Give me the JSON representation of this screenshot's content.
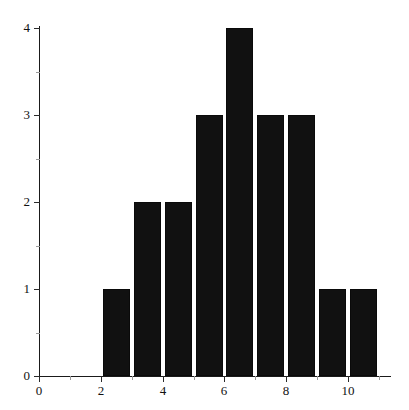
{
  "chart_data": {
    "type": "bar",
    "title": "",
    "subtitle": "",
    "xlabel": "",
    "ylabel": "",
    "grid": false,
    "legend": false,
    "legend_position": "none",
    "bar_color": "#111111",
    "axis_color": "#1a1a1a",
    "xlim": [
      0,
      11.4
    ],
    "ylim": [
      0,
      4
    ],
    "x_ticks_major": [
      0,
      2,
      4,
      6,
      8,
      10
    ],
    "x_ticks_minor": [
      1,
      3,
      5,
      7,
      9,
      11
    ],
    "x_tick_labels": [
      "0",
      "2",
      "4",
      "6",
      "8",
      "10"
    ],
    "y_ticks_major": [
      0,
      1,
      2,
      3,
      4
    ],
    "y_ticks_minor": [
      0.5,
      1.5,
      2.5,
      3.5
    ],
    "y_tick_labels": [
      "0",
      "1",
      "2",
      "3",
      "4"
    ],
    "bin_width": 1,
    "bins": [
      {
        "left": 2,
        "right": 3,
        "count": 1
      },
      {
        "left": 3,
        "right": 4,
        "count": 2
      },
      {
        "left": 4,
        "right": 5,
        "count": 2
      },
      {
        "left": 5,
        "right": 6,
        "count": 3
      },
      {
        "left": 6,
        "right": 7,
        "count": 4
      },
      {
        "left": 7,
        "right": 8,
        "count": 3
      },
      {
        "left": 8,
        "right": 9,
        "count": 3
      },
      {
        "left": 9,
        "right": 10,
        "count": 1
      },
      {
        "left": 10,
        "right": 11,
        "count": 1
      }
    ],
    "categories": [
      "2-3",
      "3-4",
      "4-5",
      "5-6",
      "6-7",
      "7-8",
      "8-9",
      "9-10",
      "10-11"
    ],
    "values": [
      1,
      2,
      2,
      3,
      4,
      3,
      3,
      1,
      1
    ]
  },
  "plot": {
    "origin_x_px": 39,
    "origin_y_px": 376,
    "x_unit_px": 30.9,
    "y_unit_px": 87,
    "bar_gap_px": 4
  }
}
